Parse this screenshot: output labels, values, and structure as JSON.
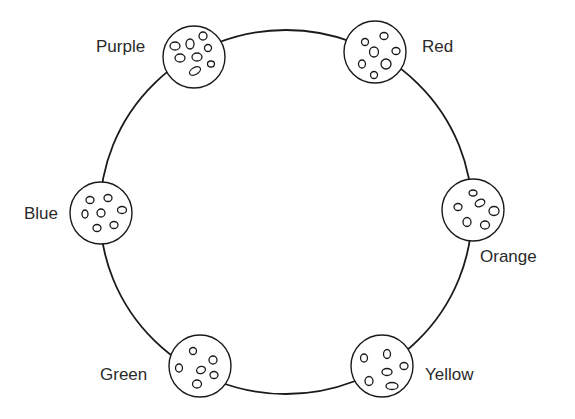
{
  "diagram": {
    "dishes": [
      {
        "id": "purple",
        "label": "Purple",
        "label_side": "left",
        "seed_count": 8
      },
      {
        "id": "red",
        "label": "Red",
        "label_side": "right",
        "seed_count": 7
      },
      {
        "id": "orange",
        "label": "Orange",
        "label_side": "below-right",
        "seed_count": 6
      },
      {
        "id": "blue",
        "label": "Blue",
        "label_side": "left",
        "seed_count": 7
      },
      {
        "id": "green",
        "label": "Green",
        "label_side": "left",
        "seed_count": 6
      },
      {
        "id": "yellow",
        "label": "Yellow",
        "label_side": "right",
        "seed_count": 6
      }
    ]
  }
}
